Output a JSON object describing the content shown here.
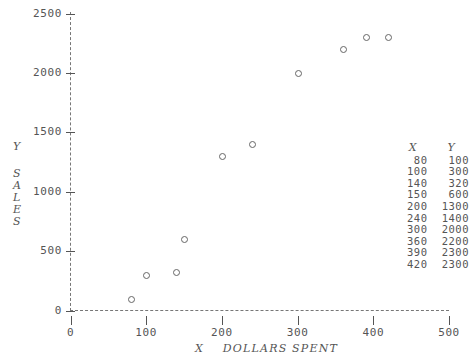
{
  "chart_data": {
    "type": "scatter",
    "title": "",
    "xlabel": "X   DOLLARS SPENT",
    "ylabel_short": "Y",
    "ylabel_long": "SALES",
    "x": [
      80,
      100,
      140,
      150,
      200,
      240,
      300,
      360,
      390,
      420
    ],
    "values": [
      100,
      300,
      320,
      600,
      1300,
      1400,
      2000,
      2200,
      2300,
      2300
    ],
    "xlim": [
      0,
      500
    ],
    "ylim": [
      0,
      2500
    ],
    "xticks": [
      0,
      100,
      200,
      300,
      400,
      500
    ],
    "yticks": [
      0,
      500,
      1000,
      1500,
      2000,
      2500
    ],
    "grid": false,
    "legend": "none",
    "marker": "open-circle",
    "marker_color": "#666666",
    "axis_color": "#777777",
    "text_color": "#555555",
    "background": "#ffffff",
    "axis_style": "dashed"
  },
  "axes": {
    "y_tick_labels": [
      "2500",
      "2000",
      "1500",
      "1000",
      "500",
      "0"
    ],
    "x_tick_labels": [
      "0",
      "100",
      "200",
      "300",
      "400",
      "500"
    ],
    "y_title_letters": [
      "Y",
      "S",
      "A",
      "L",
      "E",
      "S"
    ],
    "x_title": "X    DOLLARS SPENT"
  },
  "data_table": {
    "header_x": "X",
    "header_y": "Y",
    "rows": [
      {
        "x": "80",
        "y": "100"
      },
      {
        "x": "100",
        "y": "300"
      },
      {
        "x": "140",
        "y": "320"
      },
      {
        "x": "150",
        "y": "600"
      },
      {
        "x": "200",
        "y": "1300"
      },
      {
        "x": "240",
        "y": "1400"
      },
      {
        "x": "300",
        "y": "2000"
      },
      {
        "x": "360",
        "y": "2200"
      },
      {
        "x": "390",
        "y": "2300"
      },
      {
        "x": "420",
        "y": "2300"
      }
    ]
  }
}
